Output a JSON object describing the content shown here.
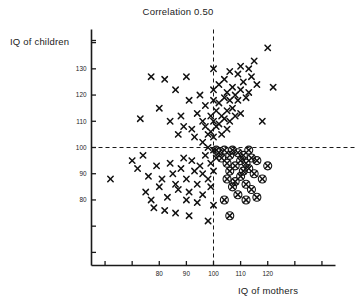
{
  "chart_data": {
    "type": "scatter",
    "title": "Correlation 0.50",
    "xlabel": "IQ of mothers",
    "ylabel": "IQ of children",
    "xlim": [
      55,
      145
    ],
    "ylim": [
      55,
      145
    ],
    "xticks": [
      60,
      70,
      80,
      90,
      100,
      110,
      120,
      130,
      140
    ],
    "xtick_labels": [
      "",
      "",
      "80",
      "90",
      "100",
      "110",
      "120",
      "",
      ""
    ],
    "yticks": [
      60,
      70,
      80,
      90,
      100,
      110,
      120,
      130,
      140
    ],
    "ytick_labels": [
      "",
      "",
      "80",
      "90",
      "100",
      "110",
      "120",
      "130",
      ""
    ],
    "grid": false,
    "legend": "none",
    "reference_lines": [
      {
        "name": "mother-iq-100-vline",
        "orientation": "vertical",
        "value": 100,
        "style": "dashed"
      },
      {
        "name": "child-iq-100-hline",
        "orientation": "horizontal",
        "value": 100,
        "style": "dashed"
      }
    ],
    "marker_styles": {
      "x": "x-marker",
      "circled_x": "circled-x-marker"
    },
    "series": [
      {
        "name": "mother-child IQ pairs",
        "marker": "x",
        "points": [
          [
            73,
            111
          ],
          [
            77,
            127
          ],
          [
            80,
            115
          ],
          [
            82,
            126
          ],
          [
            84,
            110
          ],
          [
            86,
            122
          ],
          [
            87,
            105
          ],
          [
            88,
            112
          ],
          [
            89,
            108
          ],
          [
            90,
            127
          ],
          [
            91,
            118
          ],
          [
            92,
            107
          ],
          [
            93,
            104
          ],
          [
            94,
            113
          ],
          [
            95,
            120
          ],
          [
            96,
            110
          ],
          [
            96,
            102
          ],
          [
            97,
            108
          ],
          [
            97,
            116
          ],
          [
            98,
            105
          ],
          [
            98,
            100
          ],
          [
            99,
            112
          ],
          [
            99,
            106
          ],
          [
            100,
            130
          ],
          [
            100,
            122
          ],
          [
            100,
            118
          ],
          [
            100,
            110
          ],
          [
            100,
            104
          ],
          [
            101,
            114
          ],
          [
            101,
            108
          ],
          [
            102,
            124
          ],
          [
            102,
            117
          ],
          [
            102,
            109
          ],
          [
            103,
            112
          ],
          [
            103,
            105
          ],
          [
            104,
            126
          ],
          [
            104,
            119
          ],
          [
            104,
            111
          ],
          [
            105,
            121
          ],
          [
            105,
            114
          ],
          [
            105,
            107
          ],
          [
            106,
            129
          ],
          [
            106,
            118
          ],
          [
            106,
            110
          ],
          [
            107,
            123
          ],
          [
            107,
            115
          ],
          [
            108,
            120
          ],
          [
            108,
            112
          ],
          [
            109,
            128
          ],
          [
            109,
            118
          ],
          [
            110,
            131
          ],
          [
            110,
            122
          ],
          [
            110,
            113
          ],
          [
            111,
            125
          ],
          [
            112,
            119
          ],
          [
            113,
            130
          ],
          [
            113,
            121
          ],
          [
            114,
            127
          ],
          [
            115,
            133
          ],
          [
            116,
            124
          ],
          [
            118,
            110
          ],
          [
            120,
            138
          ],
          [
            122,
            123
          ],
          [
            70,
            95
          ],
          [
            72,
            92
          ],
          [
            74,
            97
          ],
          [
            75,
            83
          ],
          [
            76,
            89
          ],
          [
            77,
            80
          ],
          [
            78,
            77
          ],
          [
            79,
            93
          ],
          [
            80,
            85
          ],
          [
            81,
            88
          ],
          [
            82,
            76
          ],
          [
            83,
            81
          ],
          [
            84,
            94
          ],
          [
            85,
            90
          ],
          [
            86,
            86
          ],
          [
            86,
            75
          ],
          [
            87,
            84
          ],
          [
            88,
            92
          ],
          [
            89,
            96
          ],
          [
            90,
            88
          ],
          [
            90,
            80
          ],
          [
            91,
            83
          ],
          [
            91,
            74
          ],
          [
            92,
            95
          ],
          [
            93,
            91
          ],
          [
            94,
            86
          ],
          [
            94,
            79
          ],
          [
            95,
            93
          ],
          [
            96,
            90
          ],
          [
            96,
            82
          ],
          [
            97,
            97
          ],
          [
            98,
            88
          ],
          [
            98,
            72
          ],
          [
            99,
            94
          ],
          [
            99,
            85
          ],
          [
            100,
            99
          ],
          [
            100,
            91
          ],
          [
            100,
            78
          ],
          [
            101,
            96
          ],
          [
            62,
            88
          ]
        ]
      },
      {
        "name": "mother-child IQ pairs (circled)",
        "marker": "circled_x",
        "points": [
          [
            101,
            99
          ],
          [
            102,
            98
          ],
          [
            103,
            96
          ],
          [
            104,
            99
          ],
          [
            105,
            94
          ],
          [
            105,
            88
          ],
          [
            106,
            97
          ],
          [
            106,
            91
          ],
          [
            107,
            99
          ],
          [
            107,
            85
          ],
          [
            108,
            93
          ],
          [
            108,
            87
          ],
          [
            109,
            98
          ],
          [
            109,
            82
          ],
          [
            110,
            95
          ],
          [
            110,
            89
          ],
          [
            111,
            97
          ],
          [
            111,
            91
          ],
          [
            112,
            94
          ],
          [
            112,
            86
          ],
          [
            113,
            99
          ],
          [
            113,
            92
          ],
          [
            114,
            96
          ],
          [
            114,
            84
          ],
          [
            115,
            90
          ],
          [
            116,
            95
          ],
          [
            116,
            81
          ],
          [
            118,
            88
          ],
          [
            120,
            93
          ],
          [
            104,
            80
          ],
          [
            106,
            74
          ],
          [
            112,
            80
          ]
        ]
      }
    ]
  },
  "axes": {
    "y_axis_name": "y-axis",
    "x_axis_name": "x-axis"
  }
}
